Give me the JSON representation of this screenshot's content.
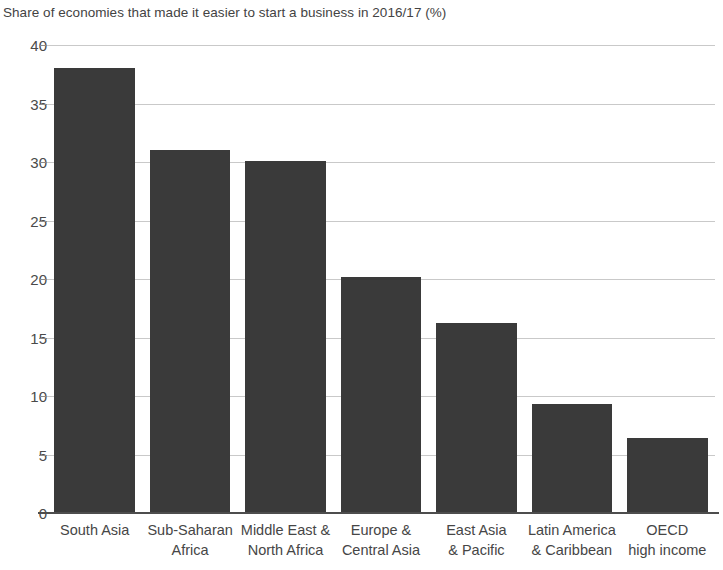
{
  "chart_data": {
    "type": "bar",
    "title": "Share of economies that made it easier to start a business in 2016/17 (%)",
    "xlabel": "",
    "ylabel": "",
    "ylim": [
      0,
      40
    ],
    "yticks": [
      0,
      5,
      10,
      15,
      20,
      25,
      30,
      35,
      40
    ],
    "ytick_labels": [
      "0",
      "5",
      "10",
      "15",
      "20",
      "25",
      "30",
      "35",
      "40"
    ],
    "grid": true,
    "legend": "none",
    "bar_color": "#3a3a3a",
    "categories": [
      "South Asia",
      "Sub-Saharan Africa",
      "Middle East & North Africa",
      "Europe & Central Asia",
      "East Asia & Pacific",
      "Latin America & Caribbean",
      "OECD high income"
    ],
    "category_lines": [
      [
        "South Asia",
        ""
      ],
      [
        "Sub-Saharan",
        "Africa"
      ],
      [
        "Middle East &",
        "North Africa"
      ],
      [
        "Europe &",
        "Central Asia"
      ],
      [
        "East Asia",
        "& Pacific"
      ],
      [
        "Latin America",
        "& Caribbean"
      ],
      [
        "OECD",
        "high income"
      ]
    ],
    "values": [
      38.0,
      31.0,
      30.1,
      20.2,
      16.2,
      9.3,
      6.4
    ]
  }
}
